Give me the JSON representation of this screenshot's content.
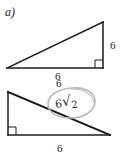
{
  "figure": {
    "part_label": "a)",
    "background_color": "#ffffff",
    "line_color": "#1a1a1a",
    "annotation_color": "#2b2b2b",
    "annotation_circle_color": "#b5b5b5",
    "upper_triangle": {
      "name": "upper-right-triangle",
      "right_angle_position": "bottom-right",
      "vertices": [
        [
          7,
          68
        ],
        [
          103,
          22
        ],
        [
          103,
          68
        ]
      ],
      "vertical_leg_label": "6",
      "horizontal_leg_label": "6"
    },
    "lower_triangle": {
      "name": "lower-right-triangle",
      "right_angle_position": "bottom-left",
      "vertices": [
        [
          8,
          92
        ],
        [
          8,
          135
        ],
        [
          110,
          135
        ]
      ],
      "top_leg_label": "6",
      "bottom_leg_label": "6",
      "hypotenuse_annotation_coefficient": "6",
      "hypotenuse_annotation_radical_symbol": "√",
      "hypotenuse_annotation_radicand": "2",
      "hypotenuse_annotation_full": "6√2"
    }
  }
}
